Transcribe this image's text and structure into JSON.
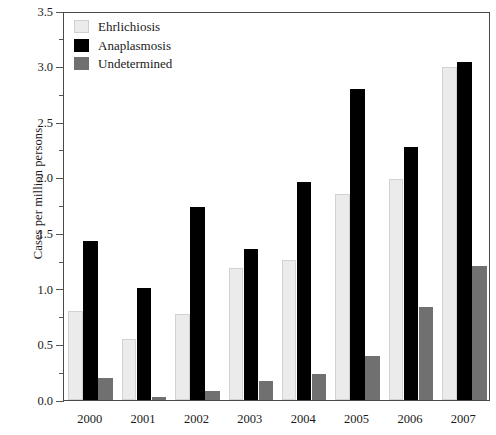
{
  "chart_data": {
    "type": "bar",
    "title": "",
    "xlabel": "",
    "ylabel": "Cases per million persons",
    "categories": [
      "2000",
      "2001",
      "2002",
      "2003",
      "2004",
      "2005",
      "2006",
      "2007"
    ],
    "series": [
      {
        "name": "Ehrlichiosis",
        "color": "#ebebeb",
        "values": [
          0.8,
          0.55,
          0.77,
          1.19,
          1.26,
          1.85,
          1.99,
          3.0
        ]
      },
      {
        "name": "Anaplasmosis",
        "color": "#000000",
        "values": [
          1.43,
          1.01,
          1.74,
          1.36,
          1.96,
          2.8,
          2.28,
          3.04
        ]
      },
      {
        "name": "Undetermined",
        "color": "#707070",
        "values": [
          0.2,
          0.03,
          0.08,
          0.17,
          0.23,
          0.4,
          0.84,
          1.21
        ]
      }
    ],
    "ylim": [
      0.0,
      3.5
    ],
    "ytick_labels": [
      "0.0",
      "0.5",
      "1.0",
      "1.5",
      "2.0",
      "2.5",
      "3.0",
      "3.5"
    ],
    "ytick_values": [
      0.0,
      0.5,
      1.0,
      1.5,
      2.0,
      2.5,
      3.0,
      3.5
    ],
    "yminor_values": [
      0.25,
      0.75,
      1.25,
      1.75,
      2.25,
      2.75,
      3.25
    ],
    "grid": false,
    "legend_position": "top-left"
  }
}
